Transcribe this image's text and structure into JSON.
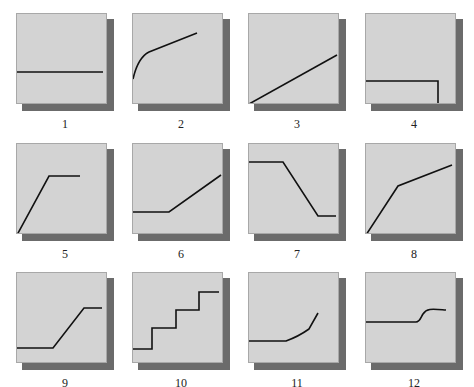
{
  "figure": {
    "panels": [
      {
        "id": 1,
        "label": "1",
        "shape": "constant",
        "path": "M0,58 L86,58"
      },
      {
        "id": 2,
        "label": "2",
        "shape": "concave-increasing",
        "path": "M0,65 C3,52 8,42 16,38 L64,19"
      },
      {
        "id": 3,
        "label": "3",
        "shape": "linear-increasing",
        "path": "M0,90 L88,41"
      },
      {
        "id": 4,
        "label": "4",
        "shape": "constant-then-drop",
        "path": "M0,67 L72,67 L72,91"
      },
      {
        "id": 5,
        "label": "5",
        "shape": "rise-then-plateau",
        "path": "M0,91 L32,32 L63,32"
      },
      {
        "id": 6,
        "label": "6",
        "shape": "flat-then-rise",
        "path": "M0,68 L36,68 L88,31"
      },
      {
        "id": 7,
        "label": "7",
        "shape": "plateau-decline-plateau",
        "path": "M0,18 L34,18 L69,72 L87,72"
      },
      {
        "id": 8,
        "label": "8",
        "shape": "steep-then-gentle-rise",
        "path": "M0,91 L32,42 L86,21"
      },
      {
        "id": 9,
        "label": "9",
        "shape": "flat-rise-plateau",
        "path": "M0,75 L36,75 L67,35 L85,35"
      },
      {
        "id": 10,
        "label": "10",
        "shape": "staircase",
        "path": "M0,76 L19,76 L19,55 L43,55 L43,37 L66,37 L66,19 L86,19"
      },
      {
        "id": 11,
        "label": "11",
        "shape": "flat-then-accelerating",
        "path": "M0,68 L37,68 C48,64 53,61 60,56 L69,40"
      },
      {
        "id": 12,
        "label": "12",
        "shape": "flat-then-sigmoid-step",
        "path": "M0,49 L50,49 C54,49 55,44 57,41 C61,35 66,36 80,37"
      }
    ]
  },
  "style": {
    "panel_fill": "#d3d3d3",
    "shadow": "#6b6b6b",
    "line": "#111111"
  }
}
